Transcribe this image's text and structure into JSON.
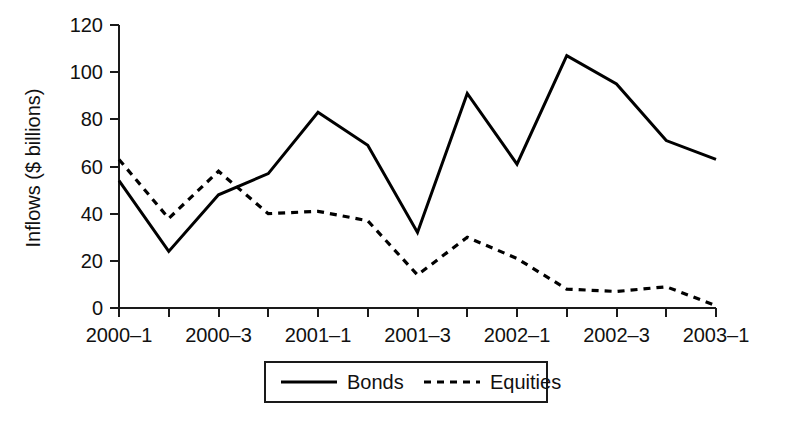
{
  "chart_data": {
    "type": "line",
    "title": "",
    "xlabel": "",
    "ylabel": "Inflows ($ billions)",
    "x": [
      "2000-1",
      "2000-2",
      "2000-3",
      "2000-4",
      "2001-1",
      "2001-2",
      "2001-3",
      "2001-4",
      "2002-1",
      "2002-2",
      "2002-3",
      "2002-4",
      "2003-1"
    ],
    "categories": [
      "2000-1",
      "2000-2",
      "2000-3",
      "2000-4",
      "2001-1",
      "2001-2",
      "2001-3",
      "2001-4",
      "2002-1",
      "2002-2",
      "2002-3",
      "2002-4",
      "2003-1"
    ],
    "xtick_labels": [
      "2000–1",
      "2000–3",
      "2001–1",
      "2001–3",
      "2002–1",
      "2002–3",
      "2003–1"
    ],
    "xtick_indices": [
      0,
      2,
      4,
      6,
      8,
      10,
      12
    ],
    "ytick_labels": [
      "0",
      "20",
      "40",
      "60",
      "80",
      "100",
      "120"
    ],
    "ytick_values": [
      0,
      20,
      40,
      60,
      80,
      100,
      120
    ],
    "ylim": [
      0,
      120
    ],
    "grid": false,
    "legend_position": "bottom-center",
    "series": [
      {
        "name": "Bonds",
        "style": "solid",
        "color": "#000000",
        "values": [
          54,
          24,
          48,
          57,
          83,
          69,
          32,
          91,
          61,
          107,
          95,
          71,
          63
        ]
      },
      {
        "name": "Equities",
        "style": "dashed",
        "color": "#000000",
        "values": [
          63,
          38,
          58,
          40,
          41,
          37,
          14,
          30,
          21,
          8,
          7,
          9,
          1
        ]
      }
    ]
  },
  "legend": {
    "items": [
      {
        "label": "Bonds",
        "style": "solid"
      },
      {
        "label": "Equities",
        "style": "dashed"
      }
    ]
  },
  "axes": {
    "y_axis_title": "Inflows ($ billions)"
  }
}
